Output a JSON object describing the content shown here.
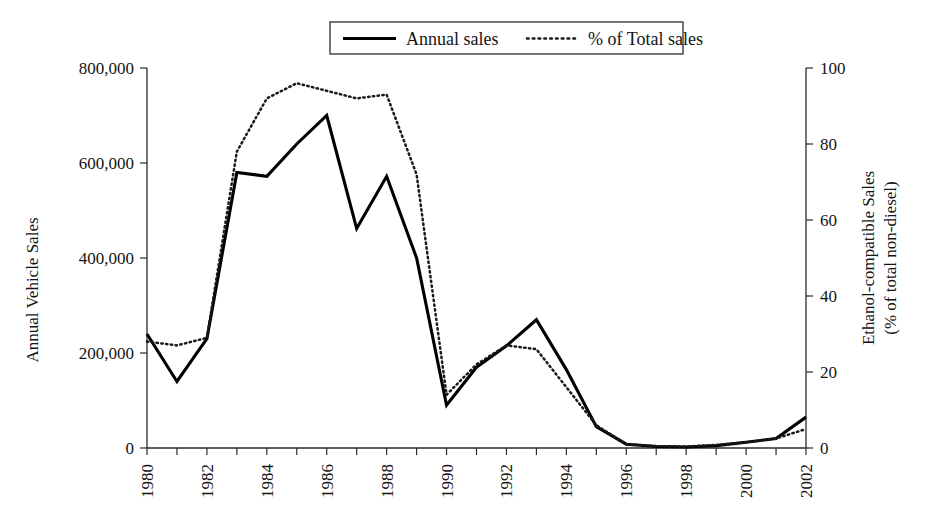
{
  "chart_data": {
    "type": "line",
    "title": "",
    "xlabel": "",
    "ylabel": "Annual Vehicle Sales",
    "y2label_line1": "Ethanol-compatible Sales",
    "y2label_line2": "(% of total non-diesel)",
    "x": [
      1980,
      1981,
      1982,
      1983,
      1984,
      1985,
      1986,
      1987,
      1988,
      1989,
      1990,
      1991,
      1992,
      1993,
      1994,
      1995,
      1996,
      1997,
      1998,
      1999,
      2000,
      2001,
      2002
    ],
    "xtick_labels": [
      "1980",
      "1982",
      "1984",
      "1986",
      "1988",
      "1990",
      "1992",
      "1994",
      "1996",
      "1998",
      "2000",
      "2002"
    ],
    "xtick_values": [
      1980,
      1982,
      1984,
      1986,
      1988,
      1990,
      1992,
      1994,
      1996,
      1998,
      2000,
      2002
    ],
    "xlim": [
      1980,
      2002
    ],
    "ylim": [
      0,
      800000
    ],
    "ytick_labels": [
      "0",
      "200,000",
      "400,000",
      "600,000",
      "800,000"
    ],
    "ytick_values": [
      0,
      200000,
      400000,
      600000,
      800000
    ],
    "y2lim": [
      0,
      100
    ],
    "y2tick_labels": [
      "0",
      "20",
      "40",
      "60",
      "80",
      "100"
    ],
    "y2tick_values": [
      0,
      20,
      40,
      60,
      80,
      100
    ],
    "grid": false,
    "legend_position": "top-center",
    "series": [
      {
        "name": "Annual sales",
        "axis": "left",
        "style": "solid",
        "values": [
          240000,
          140000,
          230000,
          580000,
          572000,
          640000,
          700000,
          462000,
          572000,
          400000,
          90000,
          170000,
          215000,
          270000,
          165000,
          45000,
          8000,
          3000,
          2000,
          5000,
          12000,
          20000,
          65000
        ]
      },
      {
        "name": "% of Total sales",
        "axis": "right",
        "style": "dotted",
        "values": [
          28,
          27,
          29,
          78,
          92,
          96,
          94,
          92,
          93,
          72,
          14,
          22,
          27,
          26,
          16,
          6,
          1,
          0.5,
          0.4,
          0.8,
          1.5,
          2.5,
          5
        ]
      }
    ],
    "legend": [
      {
        "label": "Annual sales",
        "style": "solid"
      },
      {
        "label": "% of Total sales",
        "style": "dotted"
      }
    ]
  }
}
